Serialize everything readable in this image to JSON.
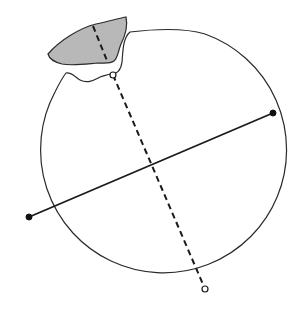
{
  "diagram": {
    "type": "broken-disc-diameters",
    "colors": {
      "outline": "#2a2a2a",
      "fragment_fill": "#b8b8b8",
      "line": "#1a1a1a",
      "background": "#ffffff"
    },
    "circle": {
      "cx": 152,
      "cy": 168,
      "r": 123
    },
    "solid_diameter": {
      "start": {
        "x": 29,
        "y": 217
      },
      "end": {
        "x": 273,
        "y": 113
      },
      "endpoint_style": "filled-dot"
    },
    "dashed_chord": {
      "start": {
        "x": 113,
        "y": 75
      },
      "end": {
        "x": 205,
        "y": 289
      },
      "endpoint_style": "open-dot"
    },
    "fragment_dashed_segment": {
      "start": {
        "x": 93,
        "y": 26
      },
      "end": {
        "x": 108,
        "y": 63
      }
    },
    "intersection": {
      "x": 152,
      "y": 168
    }
  }
}
